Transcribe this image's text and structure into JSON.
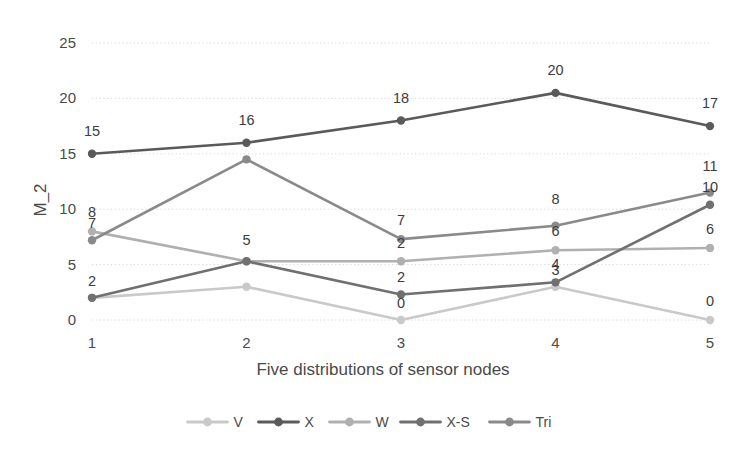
{
  "chart_data": {
    "type": "line",
    "title": "",
    "xlabel": "Five distributions of sensor nodes",
    "ylabel": "M_2",
    "categories": [
      "1",
      "2",
      "3",
      "4",
      "5"
    ],
    "x": [
      1,
      2,
      3,
      4,
      5
    ],
    "xlim": [
      1,
      5
    ],
    "ylim": [
      0,
      25
    ],
    "yticks": [
      0,
      5,
      10,
      15,
      20,
      25
    ],
    "xticks": [
      "1",
      "2",
      "3",
      "4",
      "5"
    ],
    "grid": "horizontal-dotted",
    "legend_position": "bottom",
    "series": [
      {
        "name": "V",
        "color": "#c9c9c9",
        "values": [
          2,
          3,
          0,
          3,
          0
        ],
        "labels": [
          "2",
          "",
          "0",
          "3",
          "0"
        ]
      },
      {
        "name": "X",
        "color": "#5a5a5a",
        "values": [
          15,
          16,
          18,
          20.5,
          17.5
        ],
        "labels": [
          "15",
          "16",
          "18",
          "20",
          "17"
        ]
      },
      {
        "name": "W",
        "color": "#b0b0b0",
        "values": [
          8,
          5.3,
          5.3,
          6.3,
          6.5
        ],
        "labels": [
          "8",
          "5",
          "2",
          "6",
          "6"
        ]
      },
      {
        "name": "X-S",
        "color": "#707070",
        "values": [
          2,
          5.3,
          2.3,
          3.4,
          10.4
        ],
        "labels": [
          "",
          "",
          "2",
          "4",
          "10"
        ]
      },
      {
        "name": "Tri",
        "color": "#8a8a8a",
        "values": [
          7.2,
          14.5,
          7.3,
          8.5,
          11.5
        ],
        "labels": [
          "7",
          "",
          "7",
          "8",
          "11"
        ]
      }
    ],
    "data_labels_shown": true,
    "axis_color": "#cfcfcf",
    "grid_color": "#d8d8d8",
    "background": "#ffffff"
  },
  "legend": {
    "items": [
      {
        "label": "V",
        "color": "#c9c9c9"
      },
      {
        "label": "X",
        "color": "#5a5a5a"
      },
      {
        "label": "W",
        "color": "#b0b0b0"
      },
      {
        "label": "X-S",
        "color": "#707070"
      },
      {
        "label": "Tri",
        "color": "#8a8a8a"
      }
    ]
  },
  "axes": {
    "y_tick_labels": [
      "25",
      "20",
      "15",
      "10",
      "5",
      "0"
    ],
    "x_tick_labels": [
      "1",
      "2",
      "3",
      "4",
      "5"
    ],
    "y_axis_title": "M_2",
    "x_axis_title": "Five distributions of sensor nodes"
  }
}
